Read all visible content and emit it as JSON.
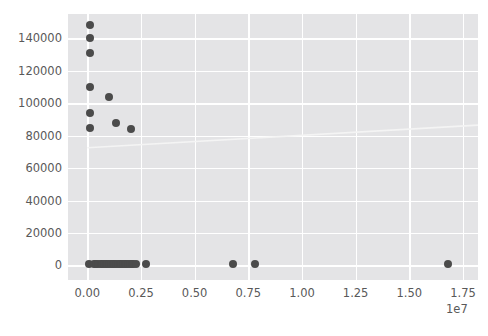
{
  "chart_data": {
    "type": "scatter",
    "title": "",
    "xlabel": "",
    "ylabel": "",
    "xlim": [
      -900000,
      18200000
    ],
    "ylim": [
      -9000,
      155000
    ],
    "grid": true,
    "legend": null,
    "x_offset_label": "1e7",
    "x_tick_labels": [
      "0.00",
      "0.25",
      "0.50",
      "0.75",
      "1.00",
      "1.25",
      "1.50",
      "1.75"
    ],
    "x_tick_values": [
      0,
      2500000,
      5000000,
      7500000,
      10000000,
      12500000,
      15000000,
      17500000
    ],
    "y_tick_labels": [
      "0",
      "20000",
      "40000",
      "60000",
      "80000",
      "100000",
      "120000",
      "140000"
    ],
    "y_tick_values": [
      0,
      20000,
      40000,
      60000,
      80000,
      100000,
      120000,
      140000
    ],
    "marker_color": "#4b4b4b",
    "marker_size": 8,
    "axes_facecolor": "#e4e4e6",
    "grid_color": "#ffffff",
    "tick_label_color": "#595959",
    "points": [
      [
        120000,
        148500
      ],
      [
        130000,
        140000
      ],
      [
        140000,
        131000
      ],
      [
        130000,
        110000
      ],
      [
        1000000,
        104000
      ],
      [
        120000,
        94000
      ],
      [
        130000,
        85000
      ],
      [
        1350000,
        88000
      ],
      [
        2050000,
        84000
      ],
      [
        90000,
        1000
      ],
      [
        300000,
        1000
      ],
      [
        420000,
        1000
      ],
      [
        520000,
        1000
      ],
      [
        620000,
        1000
      ],
      [
        700000,
        1000
      ],
      [
        780000,
        1000
      ],
      [
        860000,
        1000
      ],
      [
        940000,
        1000
      ],
      [
        1020000,
        1000
      ],
      [
        1100000,
        1000
      ],
      [
        1180000,
        1000
      ],
      [
        1260000,
        1000
      ],
      [
        1340000,
        1000
      ],
      [
        1420000,
        1000
      ],
      [
        1500000,
        1000
      ],
      [
        1580000,
        1000
      ],
      [
        1660000,
        1000
      ],
      [
        1740000,
        1000
      ],
      [
        1820000,
        1000
      ],
      [
        1900000,
        1000
      ],
      [
        1980000,
        1000
      ],
      [
        2060000,
        1000
      ],
      [
        2140000,
        1000
      ],
      [
        2250000,
        1000
      ],
      [
        2750000,
        1000
      ],
      [
        6800000,
        1000
      ],
      [
        7800000,
        1000
      ],
      [
        16800000,
        1000
      ]
    ],
    "trendline": {
      "color": "#f4f4f4",
      "x_start": 0,
      "y_start": 72500,
      "x_end": 18200000,
      "y_end": 86500
    }
  }
}
